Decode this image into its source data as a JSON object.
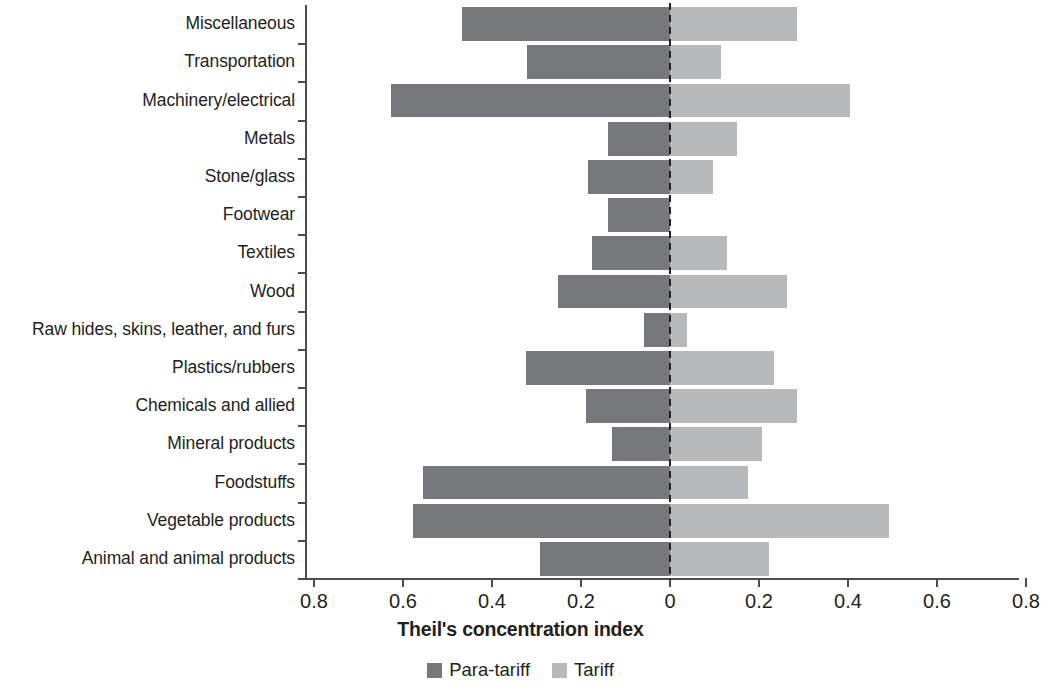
{
  "chart_data": {
    "type": "bar",
    "orientation": "horizontal",
    "layout": "diverging",
    "title": "",
    "xlabel": "Theil's concentration index",
    "ylabel": "",
    "xlim": [
      -0.8,
      0.8
    ],
    "xtick_values": [
      -0.8,
      -0.6,
      -0.4,
      -0.2,
      0,
      0.2,
      0.4,
      0.6,
      0.8
    ],
    "xtick_labels": [
      "0.8",
      "0.6",
      "0.4",
      "0.2",
      "0",
      "0.2",
      "0.4",
      "0.6",
      "0.8"
    ],
    "grid": false,
    "legend_position": "bottom",
    "categories": [
      "Miscellaneous",
      "Transportation",
      "Machinery/electrical",
      "Metals",
      "Stone/glass",
      "Footwear",
      "Textiles",
      "Wood",
      "Raw hides, skins, leather, and furs",
      "Plastics/rubbers",
      "Chemicals and allied",
      "Mineral products",
      "Foodstuffs",
      "Vegetable products",
      "Animal and animal products"
    ],
    "series": [
      {
        "name": "Para-tariff",
        "color": "#77787b",
        "side": "left",
        "values": [
          0.467,
          0.322,
          0.627,
          0.139,
          0.184,
          0.14,
          0.175,
          0.251,
          0.058,
          0.323,
          0.189,
          0.13,
          0.555,
          0.578,
          0.292
        ]
      },
      {
        "name": "Tariff",
        "color": "#b8b9bb",
        "side": "right",
        "values": [
          0.285,
          0.115,
          0.404,
          0.15,
          0.097,
          0.0,
          0.128,
          0.263,
          0.038,
          0.234,
          0.285,
          0.207,
          0.175,
          0.492,
          0.222
        ]
      }
    ]
  },
  "legend": {
    "entries": [
      {
        "label": "Para-tariff",
        "color": "#77787b"
      },
      {
        "label": "Tariff",
        "color": "#b8b9bb"
      }
    ]
  }
}
